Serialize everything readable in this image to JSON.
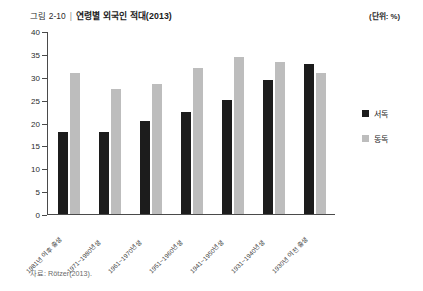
{
  "header": {
    "figure_number": "그림 2-10",
    "separator": "|",
    "title": "연령별 외국인 적대(2013)",
    "unit_note": "(단위: %)"
  },
  "source": {
    "text": "자료: Rötzer(2013)."
  },
  "legend": {
    "position": "right",
    "items": [
      {
        "label": "서독",
        "color": "#1c1c1c"
      },
      {
        "label": "동독",
        "color": "#bdbdbd"
      }
    ]
  },
  "chart_data": {
    "type": "bar",
    "title": "연령별 외국인 적대(2013)",
    "xlabel": "",
    "ylabel": "",
    "unit": "%",
    "ylim": [
      0,
      40
    ],
    "yticks": [
      0,
      5,
      10,
      15,
      20,
      25,
      30,
      35,
      40
    ],
    "ytick_labels": [
      "0",
      "5",
      "10",
      "15",
      "20",
      "25",
      "30",
      "35",
      "40"
    ],
    "grid": false,
    "categories": [
      "1981년 이후 출생",
      "1971~1980년생",
      "1961~1970년생",
      "1951~1960년생",
      "1941~1950년생",
      "1931~1940년생",
      "1930년 이전 출생"
    ],
    "series": [
      {
        "name": "서독",
        "color": "#1c1c1c",
        "values": [
          18.0,
          18.0,
          20.5,
          22.5,
          25.0,
          29.5,
          33.0
        ]
      },
      {
        "name": "동독",
        "color": "#bdbdbd",
        "values": [
          31.0,
          27.5,
          28.5,
          32.0,
          34.5,
          33.5,
          31.0
        ]
      }
    ]
  }
}
